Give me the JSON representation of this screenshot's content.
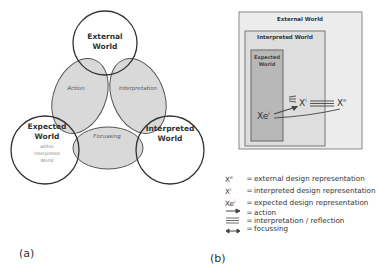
{
  "panel_a": {
    "label": "(a)",
    "circles": {
      "external": {
        "line1": "External",
        "line2": "World"
      },
      "expected": {
        "line1": "Expected",
        "line2": "World",
        "sub1": "within",
        "sub2": "Interpreted",
        "sub3": "World"
      },
      "interpreted": {
        "line1": "Interpreted",
        "line2": "World"
      }
    },
    "overlaps": {
      "action": "Action",
      "interpretation": "Interpretation",
      "focussing": "Focussing"
    },
    "colors": {
      "stroke": "#3a3a3a",
      "overlap_fill": "#d9d9d9"
    }
  },
  "panel_b": {
    "label": "(b)",
    "boxes": {
      "external": "External World",
      "interpreted": "Interpreted World",
      "expected_line1": "Expected",
      "expected_line2": "World"
    },
    "symbols": {
      "xi": "X",
      "xi_sup": "i",
      "xe": "X",
      "xe_sup": "e",
      "xei": "Xe",
      "xei_sup": "i"
    },
    "legend": [
      {
        "symbol": "X",
        "sup": "e",
        "eq": "=",
        "text": "external design representation"
      },
      {
        "symbol": "X",
        "sup": "i",
        "eq": "=",
        "text": "interpreted design representation"
      },
      {
        "symbol": "Xe",
        "sup": "i",
        "eq": "=",
        "text": "expected design representation"
      },
      {
        "icon": "arrow-right-icon",
        "eq": "=",
        "text": "action"
      },
      {
        "icon": "double-arrow-icon",
        "eq": "=",
        "text": "interpretation / reflection"
      },
      {
        "icon": "bidirectional-arrow-icon",
        "eq": "=",
        "text": "focussing"
      }
    ],
    "colors": {
      "outer_fill": "#ececec",
      "inner_fill": "#dedede",
      "expected_fill": "#b8b8b8",
      "stroke": "#777777"
    }
  }
}
